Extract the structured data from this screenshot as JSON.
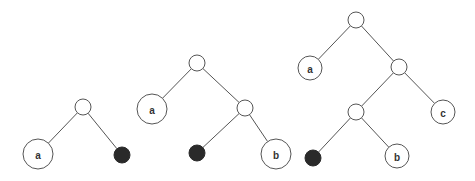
{
  "diagram": {
    "trees": [
      {
        "id": "tree-1",
        "nodes": [
          {
            "id": "r",
            "label": "",
            "kind": "internal"
          },
          {
            "id": "a",
            "label": "a",
            "kind": "leaf"
          },
          {
            "id": "x",
            "label": "",
            "kind": "filled"
          }
        ],
        "edges": [
          [
            "r",
            "a"
          ],
          [
            "r",
            "x"
          ]
        ]
      },
      {
        "id": "tree-2",
        "nodes": [
          {
            "id": "r",
            "label": "",
            "kind": "internal"
          },
          {
            "id": "a",
            "label": "a",
            "kind": "leaf"
          },
          {
            "id": "i",
            "label": "",
            "kind": "internal"
          },
          {
            "id": "x",
            "label": "",
            "kind": "filled"
          },
          {
            "id": "b",
            "label": "b",
            "kind": "leaf"
          }
        ],
        "edges": [
          [
            "r",
            "a"
          ],
          [
            "r",
            "i"
          ],
          [
            "i",
            "x"
          ],
          [
            "i",
            "b"
          ]
        ]
      },
      {
        "id": "tree-3",
        "nodes": [
          {
            "id": "r",
            "label": "",
            "kind": "internal"
          },
          {
            "id": "a",
            "label": "a",
            "kind": "leaf"
          },
          {
            "id": "i1",
            "label": "",
            "kind": "internal"
          },
          {
            "id": "c",
            "label": "c",
            "kind": "leaf"
          },
          {
            "id": "i2",
            "label": "",
            "kind": "internal"
          },
          {
            "id": "x",
            "label": "",
            "kind": "filled"
          },
          {
            "id": "b",
            "label": "b",
            "kind": "leaf"
          }
        ],
        "edges": [
          [
            "r",
            "a"
          ],
          [
            "r",
            "i1"
          ],
          [
            "i1",
            "i2"
          ],
          [
            "i1",
            "c"
          ],
          [
            "i2",
            "x"
          ],
          [
            "i2",
            "b"
          ]
        ]
      }
    ]
  }
}
